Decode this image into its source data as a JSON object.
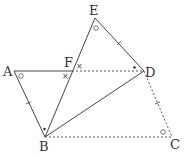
{
  "diagram": {
    "type": "geometry",
    "points": {
      "A": {
        "label": "A",
        "x": 14,
        "y": 71
      },
      "B": {
        "label": "B",
        "x": 45,
        "y": 137
      },
      "C": {
        "label": "C",
        "x": 172,
        "y": 137
      },
      "D": {
        "label": "D",
        "x": 144,
        "y": 71
      },
      "E": {
        "label": "E",
        "x": 95,
        "y": 18
      },
      "F": {
        "label": "F",
        "x": 72,
        "y": 71
      }
    },
    "solid_segments": [
      "AF",
      "AB",
      "BE",
      "ED",
      "BD"
    ],
    "dashed_segments": [
      "FD",
      "DC",
      "BC"
    ],
    "angle_marks": [
      {
        "at": "A",
        "mark": "circle"
      },
      {
        "at": "E",
        "mark": "circle"
      },
      {
        "at": "C",
        "mark": "circle"
      },
      {
        "at": "F",
        "mark": "cross",
        "count": 2
      },
      {
        "at": "D",
        "mark": "dot"
      },
      {
        "at": "B",
        "mark": "dot"
      }
    ],
    "tick_marks": [
      "AB",
      "ED",
      "DC"
    ],
    "colors": {
      "line": "#444444",
      "label": "#333333"
    }
  }
}
